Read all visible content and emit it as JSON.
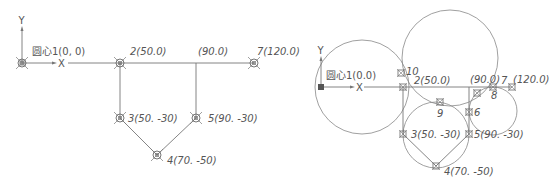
{
  "colors": {
    "line": "#777777",
    "text": "#555555",
    "marker": "#666666"
  },
  "left_diagram": {
    "axis": {
      "x_label": "X",
      "y_label": "Y"
    },
    "points": [
      {
        "id": "p1",
        "label": "圆心1(0, 0)",
        "x": 22,
        "y": 63
      },
      {
        "id": "p2",
        "label": "2(50.0)",
        "x": 120,
        "y": 63
      },
      {
        "id": "p90",
        "label": "(90.0)",
        "x": 196,
        "y": 63
      },
      {
        "id": "p7",
        "label": "7(120.0)",
        "x": 254,
        "y": 63
      },
      {
        "id": "p3",
        "label": "3(50. -30)",
        "x": 120,
        "y": 118
      },
      {
        "id": "p5",
        "label": "5(90. -30)",
        "x": 196,
        "y": 118
      },
      {
        "id": "p4",
        "label": "4(70. -50)",
        "x": 157,
        "y": 155
      }
    ]
  },
  "right_diagram": {
    "axis": {
      "x_label": "X",
      "y_label": "Y"
    },
    "points": [
      {
        "id": "r1",
        "label": "圆心1(0.0)"
      },
      {
        "id": "r10",
        "label": "10"
      },
      {
        "id": "r2",
        "label": "2(50.0)"
      },
      {
        "id": "r90",
        "label": "(90.0)"
      },
      {
        "id": "r7",
        "label": "7"
      },
      {
        "id": "r120",
        "label": "(120.0)"
      },
      {
        "id": "r8",
        "label": "8"
      },
      {
        "id": "r9",
        "label": "9"
      },
      {
        "id": "r6",
        "label": "6"
      },
      {
        "id": "r3",
        "label": "3(50. -30)"
      },
      {
        "id": "r5",
        "label": "5(90. -30)"
      },
      {
        "id": "r4",
        "label": "4(70. -50)"
      }
    ]
  }
}
